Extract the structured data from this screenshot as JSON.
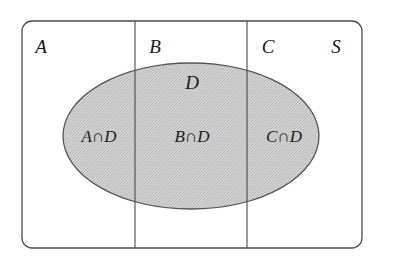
{
  "diagram": {
    "type": "venn-diagram",
    "title_visible": false,
    "universe_label": "S",
    "colors": {
      "background": "#ffffff",
      "stroke": "#4a4a4a",
      "ellipse_fill": "#c9c9c9",
      "ellipse_stroke": "#555555",
      "text": "#1a1a1a"
    },
    "partition_labels": [
      {
        "id": "A",
        "text": "A"
      },
      {
        "id": "B",
        "text": "B"
      },
      {
        "id": "C",
        "text": "C"
      }
    ],
    "ellipse_label": {
      "id": "D",
      "text": "D"
    },
    "region_labels": [
      {
        "id": "A-cap-D",
        "text": "A∩D"
      },
      {
        "id": "B-cap-D",
        "text": "B∩D"
      },
      {
        "id": "C-cap-D",
        "text": "C∩D"
      }
    ],
    "geometry": {
      "rect": {
        "x": 22,
        "y": 21,
        "width": 340,
        "height": 227,
        "radius": 10
      },
      "dividers_x": [
        135,
        247
      ],
      "ellipse": {
        "cx": 191,
        "cy": 136,
        "rx": 128,
        "ry": 73
      }
    }
  }
}
